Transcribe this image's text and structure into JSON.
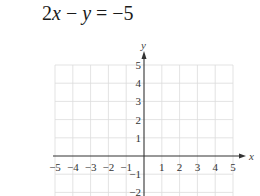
{
  "title": {
    "text": "2x − y = −5",
    "parts": [
      "2",
      "x",
      " − ",
      "y",
      " = −5"
    ]
  },
  "chart_data": {
    "type": "scatter",
    "title": "2x − y = −5",
    "xlabel": "x",
    "ylabel": "y",
    "xlim": [
      -5,
      5
    ],
    "ylim": [
      -2,
      5
    ],
    "grid": true,
    "x_ticks": [
      -5,
      -4,
      -3,
      -2,
      -1,
      1,
      2,
      3,
      4,
      5
    ],
    "y_ticks": [
      5,
      4,
      3,
      2,
      1,
      -1,
      -2
    ],
    "x_tick_labels": [
      "−5",
      "−4",
      "−3",
      "−2",
      "−1",
      "1",
      "2",
      "3",
      "4",
      "5"
    ],
    "y_tick_labels": [
      "5",
      "4",
      "3",
      "2",
      "1",
      "−1",
      "−2"
    ],
    "series": [],
    "note": "Blank coordinate grid for graphing the equation; no data plotted"
  },
  "colors": {
    "grid": "#dcdcdc",
    "axis": "#333333",
    "text": "#222222"
  }
}
